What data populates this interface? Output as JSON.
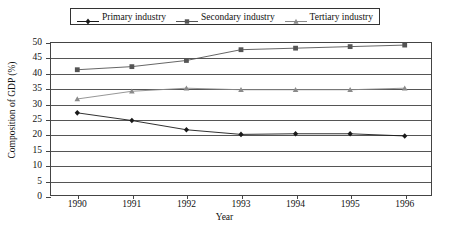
{
  "chart_data": {
    "type": "line",
    "title": "",
    "xlabel": "Year",
    "ylabel": "Composition of GDP (%)",
    "categories": [
      "1990",
      "1991",
      "1992",
      "1993",
      "1994",
      "1995",
      "1996"
    ],
    "x": [
      1990,
      1991,
      1992,
      1993,
      1994,
      1995,
      1996
    ],
    "ylim": [
      0,
      50
    ],
    "yticks": [
      0,
      5,
      10,
      15,
      20,
      25,
      30,
      35,
      40,
      45,
      50
    ],
    "grid": true,
    "legend_position": "top-center",
    "series": [
      {
        "name": "Primary industry",
        "marker": "diamond",
        "color": "#1a1a1a",
        "values": [
          27.0,
          24.5,
          21.5,
          20.0,
          20.2,
          20.2,
          19.5
        ]
      },
      {
        "name": "Secondary industry",
        "marker": "square",
        "color": "#555555",
        "values": [
          41.0,
          42.0,
          44.0,
          47.5,
          48.0,
          48.5,
          49.0
        ]
      },
      {
        "name": "Tertiary industry",
        "marker": "triangle",
        "color": "#8a8a8a",
        "values": [
          31.5,
          34.0,
          35.0,
          34.5,
          34.5,
          34.5,
          35.0
        ]
      }
    ]
  },
  "legend": {
    "items": [
      {
        "label": "Primary industry"
      },
      {
        "label": "Secondary industry"
      },
      {
        "label": "Tertiary industry"
      }
    ]
  },
  "axes": {
    "y_title": "Composition of GDP (%)",
    "x_title": "Year",
    "y_tick_labels": [
      "50",
      "45",
      "40",
      "35",
      "30",
      "25",
      "20",
      "15",
      "10",
      "5",
      "0"
    ],
    "x_tick_labels": [
      "1990",
      "1991",
      "1992",
      "1993",
      "1994",
      "1995",
      "1996"
    ]
  }
}
